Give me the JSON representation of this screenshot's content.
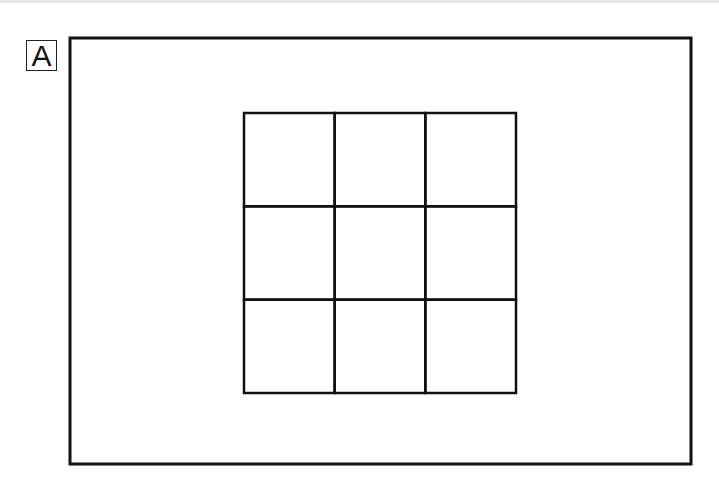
{
  "panel": {
    "label": "A"
  },
  "diagram": {
    "grid": {
      "rows": 3,
      "cols": 3
    },
    "stroke_color": "#111111",
    "background_color": "#ffffff"
  }
}
